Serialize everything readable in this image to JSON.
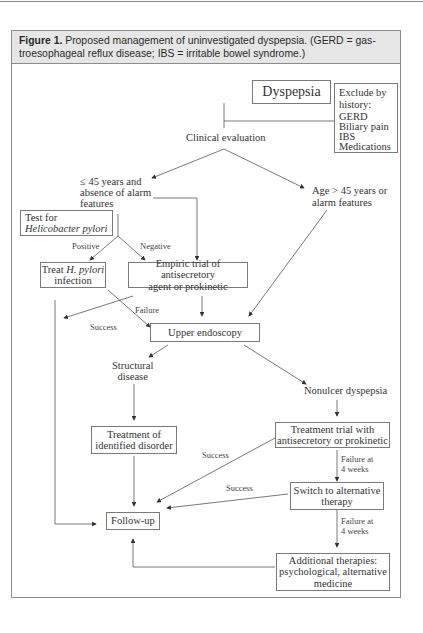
{
  "caption": {
    "figure_label": "Figure 1.",
    "text": "Proposed management of uninvestigated dyspepsia. (GERD = gastroesophageal reflux disease; IBS = irritable bowel syndrome.)",
    "line1": " Proposed management of uninvestigated dyspepsia. (GERD = gas-",
    "line2": "troesophageal reflux disease; IBS = irritable bowel syndrome.)"
  },
  "nodes": {
    "dyspepsia": "Dyspepsia",
    "exclude": {
      "title_1": "Exclude by",
      "title_2": "history:",
      "items": [
        "GERD",
        "Biliary pain",
        "IBS",
        "Medications"
      ]
    },
    "clinical_evaluation": "Clinical evaluation",
    "young": {
      "line1": "≤ 45 years and",
      "line2": "absence of alarm",
      "line3": "features"
    },
    "old": {
      "line1": "Age > 45 years or",
      "line2": "alarm features"
    },
    "test_hp": {
      "line1": "Test for",
      "line2": "Helicobacter pylori"
    },
    "treat_hp": {
      "line1_a": "Treat ",
      "line1_b": "H. pylori",
      "line2": "infection"
    },
    "empiric": {
      "line1": "Empiric trial of antisecretory",
      "line2": "agent or prokinetic"
    },
    "upper_endoscopy": "Upper endoscopy",
    "structural": {
      "line1": "Structural",
      "line2": "disease"
    },
    "nonulcer": "Nonulcer dyspepsia",
    "treat_identified": {
      "line1": "Treatment of",
      "line2": "identified disorder"
    },
    "treatment_trial": {
      "line1": "Treatment trial with",
      "line2": "antisecretory or prokinetic"
    },
    "switch": {
      "line1": "Switch to alternative",
      "line2": "therapy"
    },
    "follow_up": "Follow-up",
    "additional": {
      "line1": "Additional therapies:",
      "line2": "psychological, alternative",
      "line3": "medicine"
    }
  },
  "edge_labels": {
    "positive": "Positive",
    "negative": "Negative",
    "success_empiric": "Success",
    "failure_empiric": "Failure",
    "success_trial": "Success",
    "success_switch": "Success",
    "failure_trial_1": "Failure at",
    "failure_trial_2": "4 weeks",
    "failure_switch_1": "Failure at",
    "failure_switch_2": "4 weeks"
  }
}
